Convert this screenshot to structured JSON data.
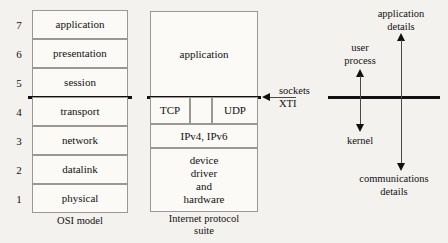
{
  "osi": {
    "caption": "OSI model",
    "layers": [
      {
        "number": "7",
        "label": "application"
      },
      {
        "number": "6",
        "label": "presentation"
      },
      {
        "number": "5",
        "label": "session"
      },
      {
        "number": "4",
        "label": "transport"
      },
      {
        "number": "3",
        "label": "network"
      },
      {
        "number": "2",
        "label": "datalink"
      },
      {
        "number": "1",
        "label": "physical"
      }
    ]
  },
  "internet": {
    "caption_line1": "Internet protocol",
    "caption_line2": "suite",
    "application": "application",
    "transport_tcp": "TCP",
    "transport_middle": "",
    "transport_udp": "UDP",
    "network": "IPv4, IPv6",
    "link_line1": "device",
    "link_line2": "driver",
    "link_line3": "and",
    "link_line4": "hardware"
  },
  "api": {
    "line1": "sockets",
    "line2": "XTI"
  },
  "annotations": {
    "user_process_line1": "user",
    "user_process_line2": "process",
    "kernel": "kernel",
    "application_details_line1": "application",
    "application_details_line2": "details",
    "communications_details_line1": "communications",
    "communications_details_line2": "details"
  },
  "colors": {
    "background": "#f4f2ee",
    "box_fill": "#fbfaf7",
    "box_border": "#9a9894",
    "thick_line": "#111111",
    "thin_line": "#4a4a4a",
    "text": "#111111"
  }
}
